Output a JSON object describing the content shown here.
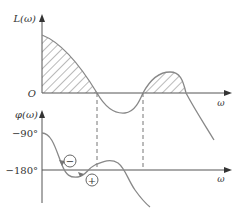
{
  "diagram": {
    "top_plot": {
      "y_label": "L(ω)",
      "origin_label": "O",
      "x_label": "ω"
    },
    "bottom_plot": {
      "y_label": "φ(ω)",
      "tick_labels": [
        "−90°",
        "−180°"
      ],
      "x_label": "ω",
      "markers": [
        "−",
        "+"
      ]
    },
    "colors": {
      "axis": "#555555",
      "curve": "#888888",
      "hatch": "#666666",
      "text": "#333333"
    }
  }
}
